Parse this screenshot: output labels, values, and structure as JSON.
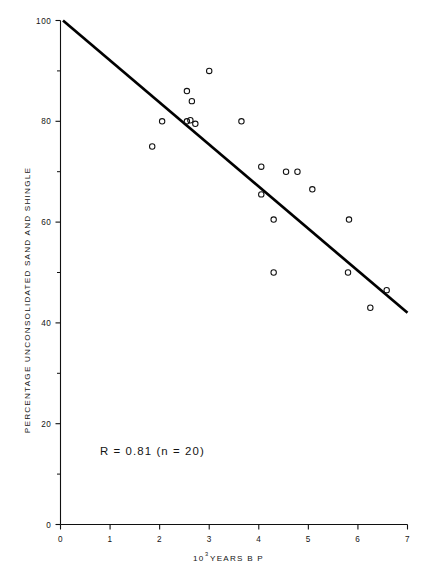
{
  "chart_data": {
    "type": "scatter",
    "title": "",
    "subtitle": "",
    "xlabel": "10^3 YEARS B P",
    "xlabel_mantissa": "10",
    "xlabel_exponent": "3",
    "xlabel_rest": "YEARS  B P",
    "ylabel": "PERCENTAGE UNCONSOLIDATED SAND AND SHINGLE",
    "xlim": [
      0,
      7
    ],
    "ylim": [
      0,
      100
    ],
    "grid": false,
    "legend": "none",
    "x_ticks": [
      "0",
      "1",
      "2",
      "3",
      "4",
      "5",
      "6",
      "7"
    ],
    "x_tick_values": [
      0,
      1,
      2,
      3,
      4,
      5,
      6,
      7
    ],
    "y_ticks": [
      "0",
      "20",
      "40",
      "60",
      "80",
      "100"
    ],
    "y_tick_values": [
      0,
      20,
      40,
      60,
      80,
      100
    ],
    "y_minor_tick_values": [
      10,
      30,
      50,
      70,
      90
    ],
    "marker": "open-circle",
    "annotation": "R = 0.81   (n = 20)",
    "annotation_r_label": "R",
    "annotation_r_value": "0.81",
    "annotation_n_label": "n",
    "annotation_n_value": "20",
    "r_value": 0.81,
    "n": 20,
    "points": [
      {
        "x": 1.85,
        "y": 75.0
      },
      {
        "x": 2.05,
        "y": 80.0
      },
      {
        "x": 2.55,
        "y": 86.0
      },
      {
        "x": 2.55,
        "y": 80.0
      },
      {
        "x": 2.65,
        "y": 84.0
      },
      {
        "x": 2.72,
        "y": 79.5
      },
      {
        "x": 3.0,
        "y": 90.0
      },
      {
        "x": 3.65,
        "y": 80.0
      },
      {
        "x": 4.05,
        "y": 71.0
      },
      {
        "x": 4.05,
        "y": 65.5
      },
      {
        "x": 4.3,
        "y": 60.5
      },
      {
        "x": 4.3,
        "y": 50.0
      },
      {
        "x": 4.55,
        "y": 70.0
      },
      {
        "x": 4.78,
        "y": 70.0
      },
      {
        "x": 5.08,
        "y": 66.5
      },
      {
        "x": 5.82,
        "y": 60.5
      },
      {
        "x": 5.8,
        "y": 50.0
      },
      {
        "x": 6.25,
        "y": 43.0
      },
      {
        "x": 6.58,
        "y": 46.5
      },
      {
        "x": 2.62,
        "y": 80.2
      }
    ],
    "fit_line": {
      "x0": 0.05,
      "y0": 100.0,
      "x1": 7.0,
      "y1": 42.0,
      "slope": -8.35,
      "intercept": 100.4
    },
    "colors": {
      "axis": "#101010",
      "marker": "#101010",
      "fit_line": "#000000",
      "text": "#141414",
      "background": "#ffffff"
    }
  }
}
